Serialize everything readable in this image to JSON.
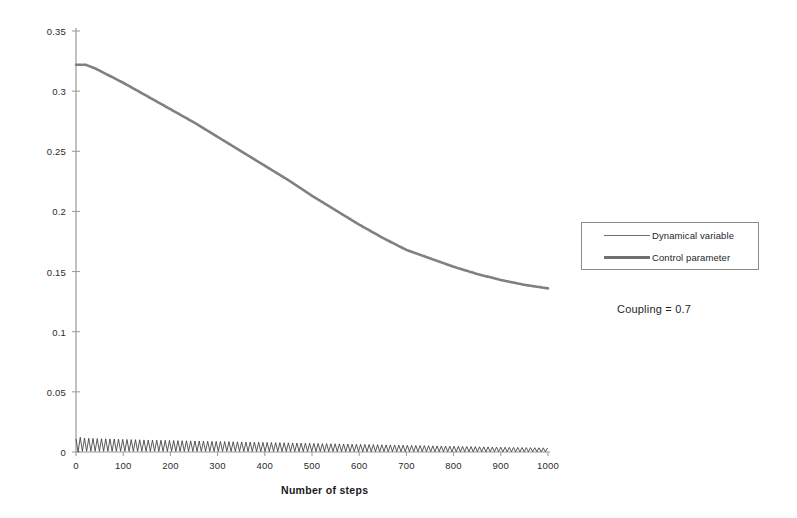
{
  "chart_data": {
    "type": "line",
    "title": "",
    "xlabel": "Number of steps",
    "ylabel": "",
    "xlim": [
      0,
      1000
    ],
    "ylim": [
      0,
      0.35
    ],
    "grid": false,
    "legend_position": "right",
    "x_ticks": [
      "0",
      "100",
      "200",
      "300",
      "400",
      "500",
      "600",
      "700",
      "800",
      "900",
      "1000"
    ],
    "x_tick_values": [
      0,
      100,
      200,
      300,
      400,
      500,
      600,
      700,
      800,
      900,
      1000
    ],
    "y_ticks": [
      "0",
      "0.05",
      "0.1",
      "0.15",
      "0.2",
      "0.25",
      "0.3",
      "0.35"
    ],
    "y_tick_values": [
      0,
      0.05,
      0.1,
      0.15,
      0.2,
      0.25,
      0.3,
      0.35
    ],
    "annotations": [
      "Coupling = 0.7"
    ],
    "series": [
      {
        "name": "Dynamical variable",
        "style": "thin",
        "color": "#4a4a4a",
        "description": "Rapidly oscillating trace hugging zero; amplitude slowly decays",
        "x": [
          0,
          5,
          10,
          20,
          40,
          60,
          80,
          100,
          150,
          200,
          250,
          300,
          350,
          400,
          450,
          500,
          550,
          600,
          650,
          700,
          750,
          800,
          850,
          900,
          950,
          1000
        ],
        "y_envelope_max": [
          0.011,
          0.013,
          0.012,
          0.0115,
          0.0112,
          0.011,
          0.0108,
          0.0105,
          0.01,
          0.0096,
          0.0092,
          0.0088,
          0.0084,
          0.008,
          0.0076,
          0.0072,
          0.0068,
          0.0064,
          0.006,
          0.0056,
          0.0052,
          0.0048,
          0.0044,
          0.004,
          0.0037,
          0.0034
        ],
        "y_envelope_min": [
          0.0,
          0.0,
          0.0005,
          0.0006,
          0.0006,
          0.0006,
          0.0006,
          0.0006,
          0.0006,
          0.0005,
          0.0005,
          0.0005,
          0.0005,
          0.0004,
          0.0004,
          0.0004,
          0.0004,
          0.0003,
          0.0003,
          0.0003,
          0.0003,
          0.0002,
          0.0002,
          0.0002,
          0.0002,
          0.0002
        ],
        "oscillation_period_steps": 9
      },
      {
        "name": "Control parameter",
        "style": "thick",
        "color": "#808080",
        "description": "Smoothly decaying curve from about 0.322 down to about 0.136",
        "x": [
          0,
          20,
          40,
          60,
          100,
          150,
          200,
          250,
          300,
          350,
          400,
          450,
          500,
          550,
          600,
          650,
          700,
          750,
          800,
          850,
          900,
          950,
          1000
        ],
        "y": [
          0.322,
          0.322,
          0.319,
          0.315,
          0.307,
          0.296,
          0.285,
          0.274,
          0.262,
          0.25,
          0.238,
          0.226,
          0.213,
          0.201,
          0.189,
          0.178,
          0.168,
          0.161,
          0.154,
          0.148,
          0.143,
          0.139,
          0.136
        ]
      }
    ]
  },
  "legend": {
    "entries": [
      {
        "label": "Dynamical variable"
      },
      {
        "label": "Control parameter"
      }
    ]
  },
  "annotation": {
    "coupling_text": "Coupling = 0.7"
  },
  "axes": {
    "x_title": "Number of steps"
  },
  "colors": {
    "axis": "#9a9a9a",
    "control_parameter": "#808080",
    "dynamical_variable": "#3c3c3c",
    "legend_border": "#8a8a8a",
    "text": "#1f1f1f"
  }
}
